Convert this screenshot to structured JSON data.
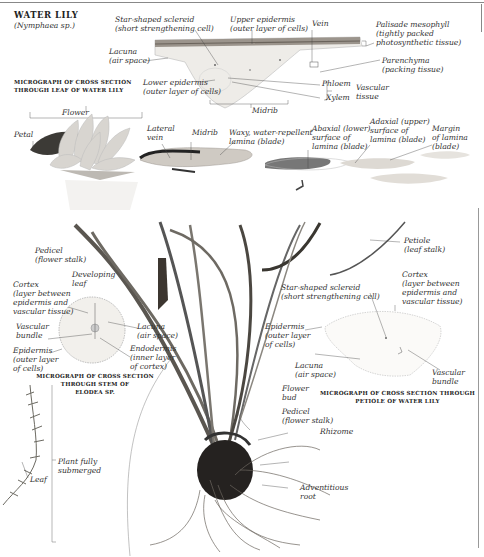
{
  "title": "WATER LILY",
  "subtitle": "(Nymphaea sp.)",
  "leaf_micrograph": {
    "caption": "MICROGRAPH OF CROSS SECTION\nTHROUGH LEAF OF WATER LILY",
    "labels": {
      "star_sclereid": "Star-shaped sclereid\n(short strengthening cell)",
      "upper_epidermis": "Upper epidermis\n(outer layer of cells)",
      "vein": "Vein",
      "palisade": "Palisade mesophyll\n(tightly packed\nphotosynthetic tissue)",
      "lacuna": "Lacuna\n(air space)",
      "parenchyma": "Parenchyma\n(packing tissue)",
      "lower_epidermis": "Lower epidermis\n(outer layer of cells)",
      "phloem": "Phloem",
      "xylem": "Xylem",
      "vascular_tissue": "Vascular\ntissue",
      "midrib": "Midrib"
    }
  },
  "plant_top": {
    "labels": {
      "flower": "Flower",
      "petal": "Petal",
      "lateral_vein": "Lateral\nvein",
      "midrib": "Midrib",
      "waxy_lamina": "Waxy, water-repellent\nlamina (blade)",
      "abaxial": "Abaxial (lower)\nsurface of\nlamina (blade)",
      "adaxial": "Adaxial (upper)\nsurface of\nlamina (blade)",
      "margin": "Margin\nof lamina\n(blade)"
    }
  },
  "elodea_micrograph": {
    "caption": "MICROGRAPH OF CROSS SECTION\nTHROUGH STEM OF\nELODEA SP.",
    "labels": {
      "pedicel": "Pedicel\n(flower stalk)",
      "developing_leaf": "Developing\nleaf",
      "cortex": "Cortex\n(layer between\nepidermis and\nvascular tissue)",
      "vascular_bundle": "Vascular\nbundle",
      "lacuna": "Lacuna\n(air space)",
      "epidermis": "Epidermis\n(outer layer\nof cells)",
      "endodermis": "Endodermis\n(inner layer\nof cortex)"
    }
  },
  "petiole_micrograph": {
    "caption": "MICROGRAPH OF CROSS SECTION THROUGH\nPETIOLE OF WATER LILY",
    "labels": {
      "petiole": "Petiole\n(leaf stalk)",
      "cortex": "Cortex\n(layer between\nepidermis and\nvascular tissue)",
      "star_sclereid": "Star-shaped sclereid\n(short strengthening cell)",
      "epidermis": "Epidermis\n(outer layer\nof cells)",
      "lacuna": "Lacuna\n(air space)",
      "vascular_bundle": "Vascular\nbundle"
    }
  },
  "plant_bottom": {
    "labels": {
      "flower_bud": "Flower\nbud",
      "pedicel": "Pedicel\n(flower stalk)",
      "rhizome": "Rhizome",
      "adventitious_root": "Adventitious\nroot",
      "plant_submerged": "Plant fully\nsubmerged",
      "leaf": "Leaf"
    }
  }
}
